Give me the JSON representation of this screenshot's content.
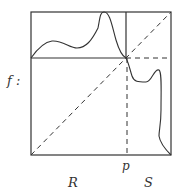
{
  "diagram": {
    "function_label": "f :",
    "point_label": "p",
    "left_region_label": "R",
    "right_region_label": "S",
    "colors": {
      "stroke": "#333333",
      "background": "#ffffff"
    },
    "box": {
      "x0": 31,
      "y0": 12,
      "x1": 171,
      "y1": 155
    },
    "fixed_point": {
      "x": 126,
      "y": 58
    }
  }
}
